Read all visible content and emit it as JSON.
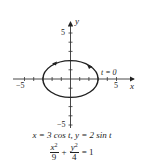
{
  "figure": {
    "axes": {
      "x_label": "x",
      "y_label": "y",
      "x_ticks": {
        "neg": "−5",
        "pos": "5"
      },
      "y_ticks": {
        "pos": "5",
        "neg": "−5"
      }
    },
    "annotation": "t = 0",
    "caption": {
      "parametric_x": "x = 3 cos t,",
      "parametric_y": "y = 2 sin t",
      "eq_num1": "x",
      "eq_num1_exp": "2",
      "eq_den1": "9",
      "eq_plus": "+",
      "eq_num2": "y",
      "eq_num2_exp": "2",
      "eq_den2": "4",
      "eq_rhs": "= 1"
    },
    "curve": {
      "type": "ellipse",
      "a": 3,
      "b": 2,
      "direction": "counterclockwise"
    },
    "colors": {
      "stroke": "#222222",
      "axis": "#333333"
    }
  }
}
